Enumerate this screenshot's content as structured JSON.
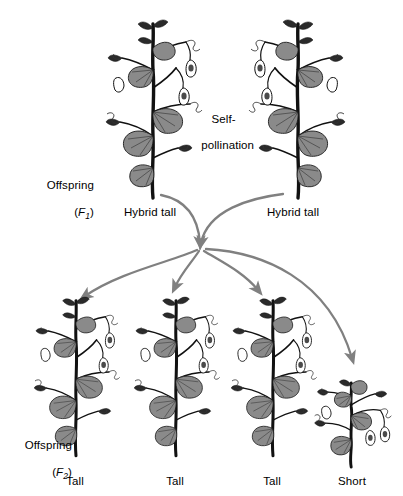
{
  "diagram": {
    "background_color": "#ffffff",
    "arrow_color": "#808080",
    "stem_color": "#111111",
    "leaf_fill": "#8a8a8a",
    "leaf_stroke": "#1a1a1a"
  },
  "generations": {
    "f1": {
      "offspring_word": "Offspring",
      "symbol": "F",
      "subscript": "1"
    },
    "f2": {
      "offspring_word": "Offspring",
      "symbol": "F",
      "subscript": "2"
    }
  },
  "annotations": {
    "self_pollination_line1": "Self-",
    "self_pollination_line2": "pollination"
  },
  "f1_plants": [
    {
      "label": "Hybrid tall",
      "type": "tall",
      "x": 150,
      "y": 212
    },
    {
      "label": "Hybrid tall",
      "type": "tall",
      "x": 293,
      "y": 212
    }
  ],
  "f2_plants": [
    {
      "label": "Tall",
      "type": "tall",
      "x": 75,
      "y": 481
    },
    {
      "label": "Tall",
      "type": "tall",
      "x": 175,
      "y": 481
    },
    {
      "label": "Tall",
      "type": "tall",
      "x": 272,
      "y": 481
    },
    {
      "label": "Short",
      "type": "short",
      "x": 352,
      "y": 481
    }
  ]
}
